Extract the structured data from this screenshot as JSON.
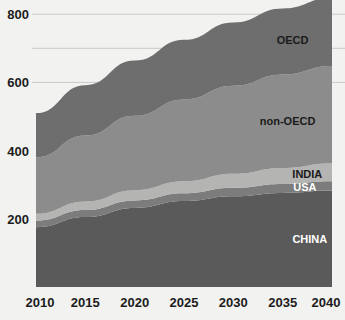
{
  "chart_data": {
    "type": "area",
    "stacked": true,
    "title": "",
    "xlabel": "",
    "ylabel": "",
    "x": [
      2010,
      2015,
      2020,
      2025,
      2030,
      2035,
      2040
    ],
    "xlim": [
      2010,
      2040
    ],
    "ylim": [
      0,
      830
    ],
    "xticks": [
      "2010",
      "2015",
      "2020",
      "2025",
      "2030",
      "2035",
      "2040"
    ],
    "yticks": [
      "200",
      "400",
      "600",
      "800"
    ],
    "ytick_values": [
      200,
      400,
      600,
      800
    ],
    "gridlines": [
      600,
      700,
      800
    ],
    "grid": true,
    "legend_position": "inline-right",
    "series": [
      {
        "name": "CHINA",
        "label": "CHINA",
        "color": "#5a5a5a",
        "label_color": "#ffffff",
        "values": [
          175,
          205,
          232,
          252,
          266,
          276,
          283
        ]
      },
      {
        "name": "USA",
        "label": "USA",
        "color": "#7c7c7c",
        "label_color": "#ffffff",
        "values": [
          20,
          21,
          22,
          23,
          25,
          26,
          27
        ]
      },
      {
        "name": "INDIA",
        "label": "INDIA",
        "color": "#b4b4b2",
        "label_color": "#1a1a1a",
        "values": [
          20,
          25,
          30,
          35,
          41,
          47,
          53
        ]
      },
      {
        "name": "non-OECD",
        "label": "non-OECD",
        "color": "#8c8c8c",
        "label_color": "#1a1a1a",
        "values": [
          165,
          193,
          218,
          240,
          258,
          274,
          285
        ]
      },
      {
        "name": "OECD",
        "label": "OECD",
        "color": "#6e6e6e",
        "label_color": "#1a1a1a",
        "values": [
          130,
          148,
          162,
          175,
          186,
          194,
          200
        ]
      }
    ],
    "totals": [
      510,
      592,
      664,
      725,
      776,
      817,
      848
    ]
  },
  "axis": {
    "y_label_200": "200",
    "y_label_400": "400",
    "y_label_600": "600",
    "y_label_800": "800",
    "x_label_2010": "2010",
    "x_label_2015": "2015",
    "x_label_2020": "2020",
    "x_label_2025": "2025",
    "x_label_2030": "2030",
    "x_label_2035": "2035",
    "x_label_2040": "2040"
  },
  "labels": {
    "oecd": "OECD",
    "non_oecd": "non-OECD",
    "india": "INDIA",
    "usa": "USA",
    "china": "CHINA"
  },
  "colors": {
    "background": "#f2f2f0",
    "oecd": "#6e6e6e",
    "non_oecd": "#8c8c8c",
    "india": "#b4b4b2",
    "usa": "#7c7c7c",
    "china": "#5a5a5a",
    "gridline": "#c9c9c6",
    "text": "#1c1c1c"
  }
}
